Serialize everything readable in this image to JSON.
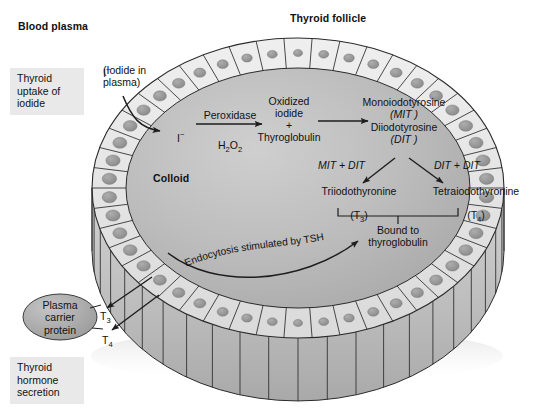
{
  "figure": {
    "title_blood_plasma": "Blood plasma",
    "title_thyroid_follicle": "Thyroid follicle",
    "colloid_label": "Colloid"
  },
  "side_labels": [
    {
      "id": "uptake",
      "text": "Thyroid\nuptake of\niodide"
    },
    {
      "id": "secretion",
      "text": "Thyroid\nhormone\nsecretion"
    }
  ],
  "callouts": {
    "iodide_plasma_symbol": "I−",
    "iodide_plasma_text": "(Iodide in\nplasma)",
    "iodide_transported_symbol": "I−"
  },
  "pathway": {
    "enzyme_top": "Peroxidase",
    "enzyme_bottom": "H2O2",
    "oxidized_iodide": "Oxidized\niodide",
    "plus": "+",
    "thyroglobulin": "Thyroglobulin",
    "mit_name": "Monoiodotyrosine",
    "mit_abbr": "(MIT )",
    "dit_name": "Diiodotyrosine",
    "dit_abbr": "(DIT )",
    "coupling_left": "MIT + DIT",
    "coupling_right": "DIT + DIT",
    "t3_name": "Triiodothyronine",
    "t3_abbr": "(T3)",
    "t4_name": "Tetraiodothyronine",
    "t4_abbr": "(T4)",
    "bound_text": "Bound to\nthyroglobulin"
  },
  "endocytosis": {
    "text": "Endocytosis stimulated by TSH"
  },
  "secretion": {
    "carrier_protein": "Plasma\ncarrier\nprotein",
    "t3_tag": "T3",
    "t4_tag": "T4"
  },
  "colors": {
    "label_box_bg": "#e9e9e9",
    "colloid": "#b9b9b9",
    "cell_fill": "#e4e4e4",
    "nucleus": "#9a9a9a",
    "rim_shadow": "#c6c6c6",
    "stroke": "#2a2a2a",
    "background": "#ffffff"
  }
}
